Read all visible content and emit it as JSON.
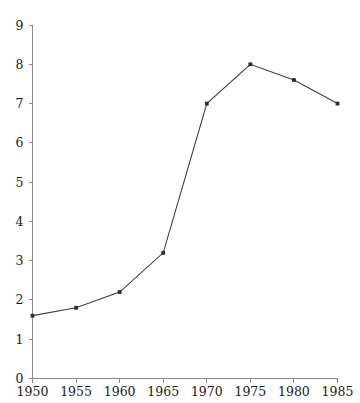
{
  "chart_data": {
    "type": "line",
    "title": "",
    "subtitle": "",
    "xlabel": "",
    "ylabel": "",
    "categories": [
      "1950",
      "1955",
      "1960",
      "1965",
      "1970",
      "1975",
      "1980",
      "1985"
    ],
    "x": [
      1950,
      1955,
      1960,
      1965,
      1970,
      1975,
      1980,
      1985
    ],
    "values": [
      1.6,
      1.8,
      2.2,
      3.2,
      7.0,
      8.0,
      7.6,
      7.0
    ],
    "series": [
      {
        "name": "",
        "values": [
          1.6,
          1.8,
          2.2,
          3.2,
          7.0,
          8.0,
          7.6,
          7.0
        ]
      }
    ],
    "xlim": [
      1950,
      1985
    ],
    "ylim": [
      0,
      9
    ],
    "xticks": [
      "1950",
      "1955",
      "1960",
      "1965",
      "1970",
      "1975",
      "1980",
      "1985"
    ],
    "yticks": [
      "0",
      "1",
      "2",
      "3",
      "4",
      "5",
      "6",
      "7",
      "8",
      "9"
    ],
    "grid": false,
    "legend": "none",
    "marker": "square",
    "line_color": "#3d3d4a",
    "marker_color": "#2b2b33",
    "axis_color": "#8a8a8a",
    "background": "#ffffff"
  },
  "axes": {
    "y_tick_labels": [
      "9",
      "8",
      "7",
      "6",
      "5",
      "4",
      "3",
      "2",
      "1",
      "0"
    ],
    "x_tick_labels": [
      "1950",
      "1955",
      "1960",
      "1965",
      "1970",
      "1975",
      "1980",
      "1985"
    ]
  }
}
